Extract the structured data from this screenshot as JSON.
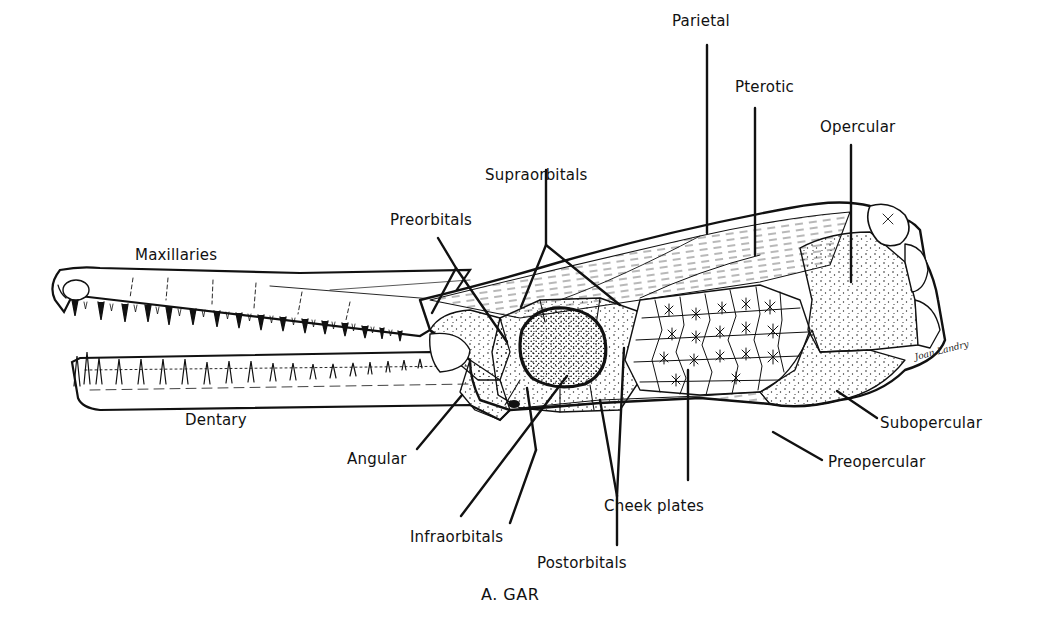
{
  "figure": {
    "caption": "A. GAR",
    "artist_signature": "Joan Landry",
    "ink_color": "#111111",
    "background_color": "#ffffff"
  },
  "labels": [
    {
      "id": "parietal",
      "text": "Parietal",
      "x": 672,
      "y": 14
    },
    {
      "id": "pterotic",
      "text": "Pterotic",
      "x": 735,
      "y": 80
    },
    {
      "id": "opercular",
      "text": "Opercular",
      "x": 820,
      "y": 120
    },
    {
      "id": "supraorbitals",
      "text": "Supraorbitals",
      "x": 485,
      "y": 168
    },
    {
      "id": "preorbitals",
      "text": "Preorbitals",
      "x": 390,
      "y": 213
    },
    {
      "id": "maxillaries",
      "text": "Maxillaries",
      "x": 135,
      "y": 248
    },
    {
      "id": "dentary",
      "text": "Dentary",
      "x": 185,
      "y": 413
    },
    {
      "id": "angular",
      "text": "Angular",
      "x": 347,
      "y": 452
    },
    {
      "id": "subopercular",
      "text": "Subopercular",
      "x": 880,
      "y": 416
    },
    {
      "id": "preopercular",
      "text": "Preopercular",
      "x": 828,
      "y": 455
    },
    {
      "id": "cheek_plates",
      "text": "Cheek plates",
      "x": 604,
      "y": 499
    },
    {
      "id": "infraorbitals",
      "text": "Infraorbitals",
      "x": 410,
      "y": 530
    },
    {
      "id": "postorbitals",
      "text": "Postorbitals",
      "x": 537,
      "y": 556
    }
  ],
  "leaders": [
    {
      "label": "parietal",
      "points": [
        [
          707,
          45
        ],
        [
          707,
          233
        ]
      ]
    },
    {
      "label": "pterotic",
      "points": [
        [
          755,
          108
        ],
        [
          755,
          255
        ]
      ]
    },
    {
      "label": "opercular",
      "points": [
        [
          851,
          145
        ],
        [
          851,
          282
        ]
      ]
    },
    {
      "label": "supraorbitals",
      "points": [
        [
          546,
          170
        ],
        [
          546,
          245
        ],
        [
          521,
          307
        ]
      ]
    },
    {
      "label": "supraorbitals",
      "points": [
        [
          546,
          245
        ],
        [
          620,
          305
        ]
      ]
    },
    {
      "label": "preorbitals",
      "points": [
        [
          438,
          238
        ],
        [
          456,
          268
        ],
        [
          432,
          313
        ]
      ]
    },
    {
      "label": "preorbitals",
      "points": [
        [
          456,
          268
        ],
        [
          507,
          342
        ]
      ]
    },
    {
      "label": "angular",
      "points": [
        [
          417,
          449
        ],
        [
          462,
          395
        ]
      ]
    },
    {
      "label": "infraorbitals",
      "points": [
        [
          461,
          516
        ],
        [
          567,
          376
        ]
      ]
    },
    {
      "label": "infraorbitals",
      "points": [
        [
          536,
          450
        ],
        [
          527,
          388
        ]
      ]
    },
    {
      "label": "infraorbitals",
      "points": [
        [
          536,
          450
        ],
        [
          510,
          523
        ]
      ]
    },
    {
      "label": "postorbitals",
      "points": [
        [
          617,
          545
        ],
        [
          617,
          496
        ]
      ]
    },
    {
      "label": "postorbitals",
      "points": [
        [
          617,
          496
        ],
        [
          600,
          400
        ]
      ]
    },
    {
      "label": "postorbitals",
      "points": [
        [
          617,
          496
        ],
        [
          624,
          348
        ]
      ]
    },
    {
      "label": "cheek_plates",
      "points": [
        [
          688,
          480
        ],
        [
          688,
          370
        ]
      ]
    },
    {
      "label": "subopercular",
      "points": [
        [
          877,
          418
        ],
        [
          837,
          391
        ]
      ]
    },
    {
      "label": "preopercular",
      "points": [
        [
          822,
          460
        ],
        [
          773,
          432
        ]
      ]
    }
  ]
}
